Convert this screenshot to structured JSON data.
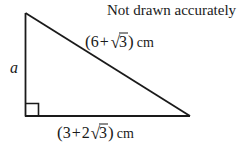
{
  "figure": {
    "type": "right-triangle-diagram",
    "note": "Not drawn accurately",
    "background_color": "#ffffff",
    "stroke_color": "#1a1a1a"
  },
  "labels": {
    "vertical_side": "a",
    "hypotenuse": {
      "open_paren": "(",
      "first_term": "6",
      "operator": "+",
      "radical_sign": "√",
      "radicand": "3",
      "close_paren": ")",
      "unit": "cm",
      "full_text": "(6 + √3) cm"
    },
    "base": {
      "open_paren": "(",
      "first_term": "3",
      "operator": "+",
      "coefficient": "2",
      "radical_sign": "√",
      "radicand": "3",
      "close_paren": ")",
      "unit": "cm",
      "full_text": "(3 + 2√3) cm"
    }
  },
  "geometry": {
    "apex": {
      "x": 25,
      "y": 13
    },
    "bottom_left": {
      "x": 25,
      "y": 116
    },
    "bottom_right": {
      "x": 190,
      "y": 116
    },
    "right_angle_marker": {
      "vertex": "bottom_left",
      "size": 13
    }
  }
}
